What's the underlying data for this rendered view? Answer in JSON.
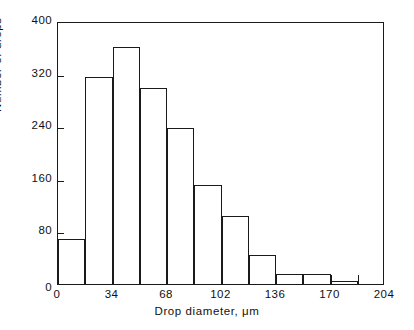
{
  "chart_data": {
    "type": "bar",
    "title": "",
    "subtitle": "",
    "xlabel": "Drop diameter,  μm",
    "ylabel": "Number of drops",
    "xlim": [
      0,
      204
    ],
    "ylim": [
      0,
      400
    ],
    "grid": false,
    "legend": null,
    "bin_width": 17,
    "x_ticks": [
      0,
      34,
      68,
      102,
      136,
      170,
      204
    ],
    "x_tick_labels": [
      "0",
      "34",
      "68",
      "102",
      "136",
      "170",
      "204"
    ],
    "x_minor_ticks": [
      17,
      51,
      85,
      119,
      153,
      187
    ],
    "y_ticks": [
      0,
      80,
      160,
      240,
      320,
      400
    ],
    "y_tick_labels": [
      "0",
      "80",
      "160",
      "240",
      "320",
      "400"
    ],
    "bin_edges": [
      0,
      17,
      34,
      51,
      68,
      85,
      102,
      119,
      136,
      153,
      170,
      187
    ],
    "categories": [
      "0-17",
      "17-34",
      "34-51",
      "51-68",
      "68-85",
      "85-102",
      "102-119",
      "119-136",
      "136-153",
      "153-170",
      "170-187"
    ],
    "values": [
      68,
      315,
      360,
      298,
      238,
      150,
      103,
      44,
      15,
      15,
      5
    ]
  },
  "axis_titles": {
    "x": "Drop diameter,  μm",
    "y": "Number of drops"
  },
  "colors": {
    "line": "#1a1a1a",
    "background": "#ffffff",
    "text": "#111111"
  }
}
